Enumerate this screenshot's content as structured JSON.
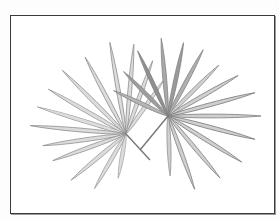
{
  "image": {
    "subject": "pencil sketch of two fan palm fronds",
    "colors": {
      "background": "#ffffff",
      "frame": "#3a3a3a",
      "leaf_light": "#c9c9c9",
      "leaf_mid": "#9d9d9d",
      "leaf_dark": "#6e6e6e"
    },
    "fronds": [
      {
        "name": "left-frond",
        "center": [
          126,
          134
        ]
      },
      {
        "name": "right-frond",
        "center": [
          168,
          116
        ]
      }
    ]
  }
}
